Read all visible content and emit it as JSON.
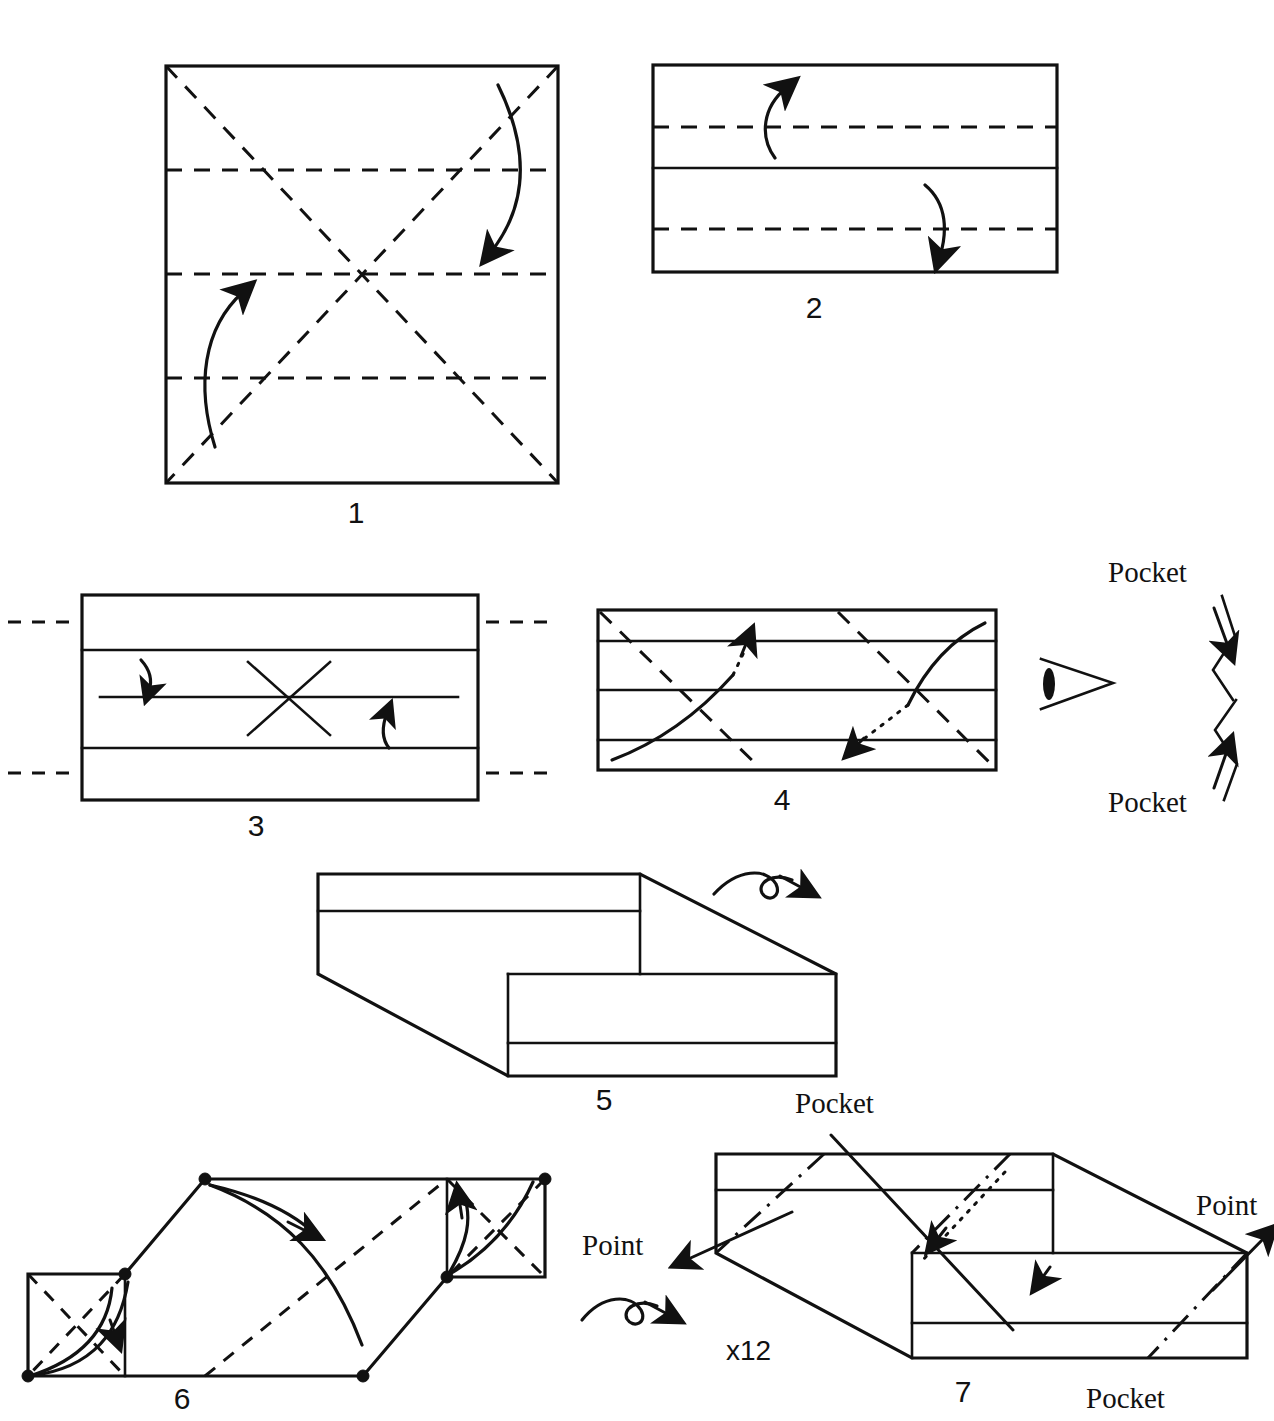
{
  "document": {
    "kind": "origami-folding-diagram",
    "title": "Modular origami folding sequence",
    "background_color": "#ffffff",
    "ink_color": "#111111"
  },
  "steps": [
    {
      "id": "step-1",
      "number": "1",
      "shape": "square",
      "creases": {
        "horizontal_dashed": 3,
        "diagonal_dashed": 2
      },
      "arrows": 2
    },
    {
      "id": "step-2",
      "number": "2",
      "shape": "rectangle",
      "creases": {
        "horizontal_solid": 1,
        "horizontal_dashed": 2
      },
      "arrows": 2
    },
    {
      "id": "step-3",
      "number": "3",
      "shape": "rectangle",
      "creases": {
        "horizontal_solid": 3,
        "dashed_extensions": 4
      },
      "marks": {
        "x_mark": 1
      },
      "arrows": 2
    },
    {
      "id": "step-4",
      "number": "4",
      "shape": "rectangle",
      "creases": {
        "horizontal_solid": 3,
        "diagonal_dashed": 2
      },
      "arrows": 2
    },
    {
      "id": "step-5",
      "number": "5",
      "shape": "offset-parallelogram-unit",
      "arrows": 1,
      "arrow_kind": "turn-over"
    },
    {
      "id": "step-6",
      "number": "6",
      "shape": "assembled-parallelogram",
      "vertex_dots": 6,
      "arrows": 3
    },
    {
      "id": "step-7",
      "number": "7",
      "shape": "offset-parallelogram-unit",
      "arrows": 3,
      "arrow_kind": "turn-over-and-points"
    }
  ],
  "labels": {
    "pocket": "Pocket",
    "point": "Point",
    "repeat_count": "x12"
  },
  "annotations": [
    {
      "id": "detail-pocket-top",
      "text": "Pocket",
      "x": 1153,
      "y": 580
    },
    {
      "id": "detail-pocket-bottom",
      "text": "Pocket",
      "x": 1153,
      "y": 810
    },
    {
      "id": "step7-pocket-top",
      "text": "Pocket",
      "x": 841,
      "y": 1111
    },
    {
      "id": "step7-pocket-bottom",
      "text": "Pocket",
      "x": 1146,
      "y": 1403
    },
    {
      "id": "step7-point-left",
      "text": "Point",
      "x": 613,
      "y": 1251
    },
    {
      "id": "step7-point-right",
      "text": "Point",
      "x": 1230,
      "y": 1212
    },
    {
      "id": "step7-repeat",
      "text": "x12",
      "x": 748,
      "y": 1353
    }
  ],
  "step_numbers": [
    {
      "id": "num-1",
      "text": "1",
      "x": 356,
      "y": 523
    },
    {
      "id": "num-2",
      "text": "2",
      "x": 814,
      "y": 318
    },
    {
      "id": "num-3",
      "text": "3",
      "x": 256,
      "y": 836
    },
    {
      "id": "num-4",
      "text": "4",
      "x": 782,
      "y": 810
    },
    {
      "id": "num-5",
      "text": "5",
      "x": 604,
      "y": 1110
    },
    {
      "id": "num-6",
      "text": "6",
      "x": 182,
      "y": 1409
    },
    {
      "id": "num-7",
      "text": "7",
      "x": 963,
      "y": 1402
    }
  ]
}
